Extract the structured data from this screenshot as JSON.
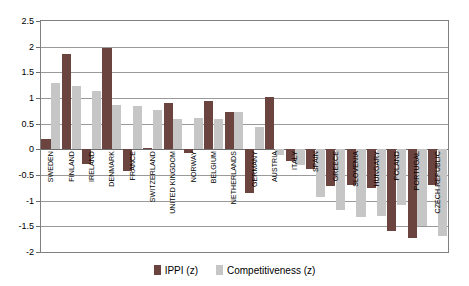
{
  "chart_data": {
    "type": "bar",
    "title": "",
    "xlabel": "",
    "ylabel": "",
    "ylim": [
      -2,
      2.5
    ],
    "ytick_step": 0.5,
    "yticks": [
      "2.5",
      "2",
      "1.5",
      "1",
      "0.5",
      "0",
      "-0.5",
      "-1",
      "-1.5",
      "-2"
    ],
    "grid": true,
    "legend_position": "bottom",
    "categories": [
      "SWEDEN",
      "FINLAND",
      "IRELAND",
      "DENMARK",
      "FRANCE",
      "SWITZERLAND",
      "UNITED KINGDOM",
      "NORWAY",
      "BELGIUM",
      "NETHERLANDS",
      "GERMANY",
      "AUSTRIA",
      "ITALY",
      "SPAIN",
      "GREECE",
      "SLOVENIA",
      "HUNGARY",
      "POLAND",
      "PORTUGAL",
      "CZECH REPUBLIC"
    ],
    "series": [
      {
        "name": "IPPI (z)",
        "color": "#6b4440",
        "values": [
          0.21,
          1.86,
          -0.28,
          1.98,
          -0.42,
          0.02,
          0.9,
          -0.07,
          0.95,
          0.72,
          -0.85,
          1.02,
          -0.23,
          -0.38,
          -0.72,
          -0.7,
          -0.75,
          -1.6,
          -1.72,
          -0.7
        ]
      },
      {
        "name": "Competitiveness (z)",
        "color": "#c6c6c6",
        "values": [
          1.29,
          1.24,
          1.14,
          0.86,
          0.84,
          0.76,
          0.6,
          0.61,
          0.6,
          0.72,
          0.44,
          -0.11,
          -0.3,
          -0.92,
          -1.18,
          -1.32,
          -1.3,
          -1.08,
          -1.5,
          -1.68
        ]
      }
    ]
  },
  "legend": {
    "items": [
      {
        "label": "IPPI (z)",
        "color": "#6b4440"
      },
      {
        "label": "Competitiveness (z)",
        "color": "#c6c6c6"
      }
    ]
  }
}
